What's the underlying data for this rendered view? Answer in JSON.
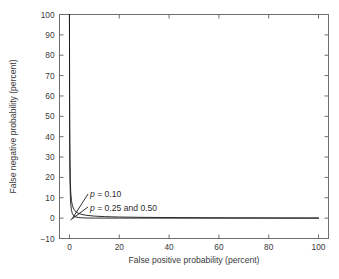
{
  "chart_data": {
    "type": "line",
    "title": "",
    "xlabel": "False positive probability (percent)",
    "ylabel": "False negative probability (percent)",
    "xlim": [
      -4,
      104
    ],
    "ylim": [
      -10,
      100
    ],
    "xticks": [
      0,
      20,
      40,
      60,
      80,
      100
    ],
    "yticks": [
      -10,
      0,
      10,
      20,
      30,
      40,
      50,
      60,
      70,
      80,
      90,
      100
    ],
    "xticklabels": [
      "0",
      "20",
      "40",
      "60",
      "80",
      "100"
    ],
    "yticklabels": [
      "−10",
      "0",
      "10",
      "20",
      "30",
      "40",
      "50",
      "60",
      "70",
      "80",
      "90",
      "100"
    ],
    "grid": false,
    "legend_position": "none",
    "line_color": "#1a1a1a",
    "frame_color": "#6e6e6e",
    "background": "#ffffff",
    "series": [
      {
        "name": "p = 0.10",
        "x": [
          0.0,
          0.05,
          0.1,
          0.2,
          0.35,
          0.5,
          0.8,
          1.2,
          1.8,
          2.5,
          3.5,
          5.0,
          7.0,
          10.0,
          14.0,
          20.0,
          28.0,
          38.0,
          50.0,
          65.0,
          80.0,
          100.0
        ],
        "y": [
          100.0,
          62.0,
          44.0,
          28.0,
          18.0,
          13.0,
          8.6,
          6.0,
          4.3,
          3.2,
          2.4,
          1.8,
          1.35,
          1.0,
          0.75,
          0.55,
          0.4,
          0.3,
          0.22,
          0.15,
          0.1,
          0.05
        ]
      },
      {
        "name": "p = 0.25 and 0.50",
        "x": [
          0.0,
          0.05,
          0.1,
          0.2,
          0.35,
          0.5,
          0.8,
          1.2,
          1.8,
          2.5,
          3.5,
          5.0,
          7.0,
          10.0,
          20.0,
          40.0,
          70.0,
          100.0
        ],
        "y": [
          100.0,
          55.0,
          36.0,
          20.0,
          11.0,
          7.0,
          3.8,
          2.1,
          1.1,
          0.6,
          0.3,
          0.15,
          0.07,
          0.03,
          0.01,
          0.0,
          0.0,
          0.0
        ]
      }
    ],
    "annotations": [
      {
        "label_p": "p",
        "label_rest": " =  0.10",
        "text": "p =  0.10",
        "text_x": 90,
        "text_y": 197,
        "leader": {
          "x1": 88,
          "y1": 194,
          "x2": 72,
          "y2": 219
        }
      },
      {
        "label_p": "p",
        "label_rest": " =  0.25 and 0.50",
        "text": "p =  0.25 and 0.50",
        "text_x": 90,
        "text_y": 211,
        "leader": {
          "x1": 88,
          "y1": 207,
          "x2": 70.5,
          "y2": 220
        }
      }
    ]
  }
}
